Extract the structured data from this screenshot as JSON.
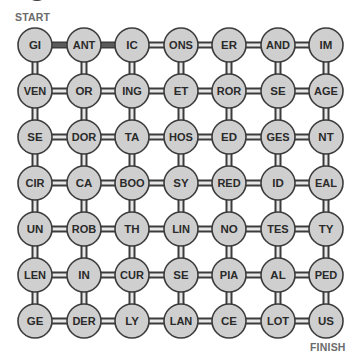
{
  "puzzle": {
    "start_label": "START",
    "finish_label": "FINISH",
    "colors": {
      "node_fill": "#cfcfcf",
      "node_stroke": "#3c3c3c",
      "connector_outer": "#3c3c3c",
      "connector_inner": "#e8e8e8",
      "highlight_path": "#5a5a5a",
      "text": "#2a2a2a",
      "label": "#6b6b6b"
    },
    "grid": {
      "columns": 7,
      "rows": 7,
      "cells": [
        [
          "GI",
          "ANT",
          "IC",
          "ONS",
          "ER",
          "AND",
          "IM"
        ],
        [
          "VEN",
          "OR",
          "ING",
          "ET",
          "ROR",
          "SE",
          "AGE"
        ],
        [
          "SE",
          "DOR",
          "TA",
          "HOS",
          "ED",
          "GES",
          "NT"
        ],
        [
          "CIR",
          "CA",
          "BOO",
          "SY",
          "RED",
          "ID",
          "EAL"
        ],
        [
          "UN",
          "ROB",
          "TH",
          "LIN",
          "NO",
          "TES",
          "TY"
        ],
        [
          "LEN",
          "IN",
          "CUR",
          "SE",
          "PIA",
          "AL",
          "PED"
        ],
        [
          "GE",
          "DER",
          "LY",
          "LAN",
          "CE",
          "LOT",
          "US"
        ]
      ]
    },
    "highlighted_path": [
      {
        "from": [
          0,
          0
        ],
        "to": [
          0,
          1
        ],
        "text": "GI-ANT"
      },
      {
        "from": [
          0,
          1
        ],
        "to": [
          0,
          2
        ],
        "text": "ANT-IC"
      }
    ]
  }
}
